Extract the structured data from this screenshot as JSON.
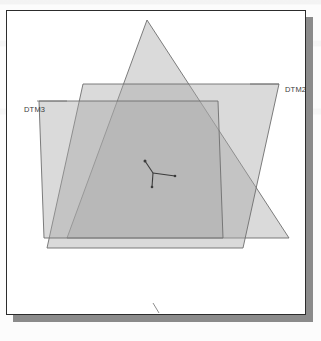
{
  "figure": {
    "type": "technical-diagram",
    "background_color": "#ffffff",
    "frame_border_color": "#2c2c2c",
    "shadow_color": "#8b8b8b",
    "outline_color": "#6e6e6e",
    "fill_color": "#9f9f9f",
    "origin_marker_color": "#3b3b3b"
  },
  "labels": {
    "dtm1": "DTM1",
    "dtm2": "DTM2",
    "dtm3": "DTM3"
  },
  "chart_data": {
    "type": "scatter",
    "title": "",
    "xlabel": "",
    "ylabel": "",
    "grid": false,
    "legend": "inline-annotations",
    "xlim": [
      0,
      300
    ],
    "ylim": [
      0,
      305
    ],
    "annotations": [
      {
        "text": "DTM2",
        "x": 272,
        "y": 73,
        "leader_to_x": 243,
        "leader_to_y": 73
      },
      {
        "text": "DTM3",
        "x": 11,
        "y": 90,
        "leader_to_x": 44,
        "leader_to_y": 90
      },
      {
        "text": "DTM1",
        "x": 154,
        "y": 305,
        "leader_to_x": 148,
        "leader_to_y": 298
      }
    ],
    "series": [
      {
        "name": "DTM1",
        "shape": "triangle",
        "fill": "#a8a8a8",
        "opacity": 0.42,
        "points": [
          [
            140,
            9
          ],
          [
            282,
            227
          ],
          [
            60,
            227
          ]
        ]
      },
      {
        "name": "DTM2",
        "shape": "parallelogram",
        "fill": "#a8a8a8",
        "opacity": 0.42,
        "points": [
          [
            76,
            73
          ],
          [
            272,
            73
          ],
          [
            236,
            237
          ],
          [
            40,
            237
          ]
        ]
      },
      {
        "name": "DTM3",
        "shape": "parallelogram",
        "fill": "#a8a8a8",
        "opacity": 0.42,
        "points": [
          [
            32,
            90
          ],
          [
            211,
            90
          ],
          [
            216,
            227
          ],
          [
            37,
            227
          ]
        ]
      }
    ],
    "origin_marker": {
      "x": 146,
      "y": 160,
      "axes": [
        {
          "name": "x-axis",
          "dx": 22,
          "dy": 3
        },
        {
          "name": "y-axis",
          "dx": -8,
          "dy": -12
        },
        {
          "name": "z-axis",
          "dx": -1,
          "dy": 14
        }
      ]
    }
  }
}
